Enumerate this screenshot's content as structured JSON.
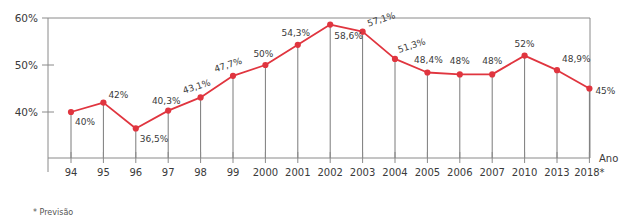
{
  "chart_data": {
    "type": "line",
    "title": "",
    "xlabel": "Ano",
    "ylabel": "",
    "ylim": [
      33,
      60
    ],
    "yticks": [
      "40%",
      "50%",
      "60%"
    ],
    "ytick_values": [
      40,
      50,
      60
    ],
    "grid": false,
    "legend": null,
    "categories": [
      "94",
      "95",
      "96",
      "97",
      "98",
      "99",
      "2000",
      "2001",
      "2002",
      "2003",
      "2004",
      "2005",
      "2006",
      "2007",
      "2010",
      "2013",
      "2018*"
    ],
    "values": [
      40,
      42,
      36.5,
      40.3,
      43.1,
      47.7,
      50,
      54.3,
      58.6,
      57.1,
      51.3,
      48.4,
      48,
      48,
      52,
      48.9,
      45
    ],
    "point_labels": [
      "40%",
      "42%",
      "36,5%",
      "40,3%",
      "43,1%",
      "47,7%",
      "50%",
      "54,3%",
      "58,6%",
      "57,1%",
      "51,3%",
      "48,4%",
      "48%",
      "48%",
      "52%",
      "48,9%",
      "45%"
    ],
    "label_positions": [
      "below-right",
      "above-right",
      "below-right",
      "above-left",
      "above-left",
      "above-left",
      "above-left",
      "above-left",
      "below-right",
      "above-right",
      "above-right-rot",
      "above-right",
      "above",
      "above",
      "above",
      "above-right",
      "right"
    ],
    "label_rotations": [
      0,
      0,
      0,
      0,
      -18,
      -18,
      0,
      0,
      0,
      -18,
      -18,
      0,
      0,
      0,
      0,
      0,
      0
    ],
    "series_color": "#e0353f",
    "marker_color": "#e0353f",
    "droplines": true,
    "dropline_color": "#7a7a7a",
    "axis_color": "#8a8a8a",
    "footnote": "* Previsão"
  },
  "axis": {
    "y_name": "",
    "x_name": "Ano"
  }
}
